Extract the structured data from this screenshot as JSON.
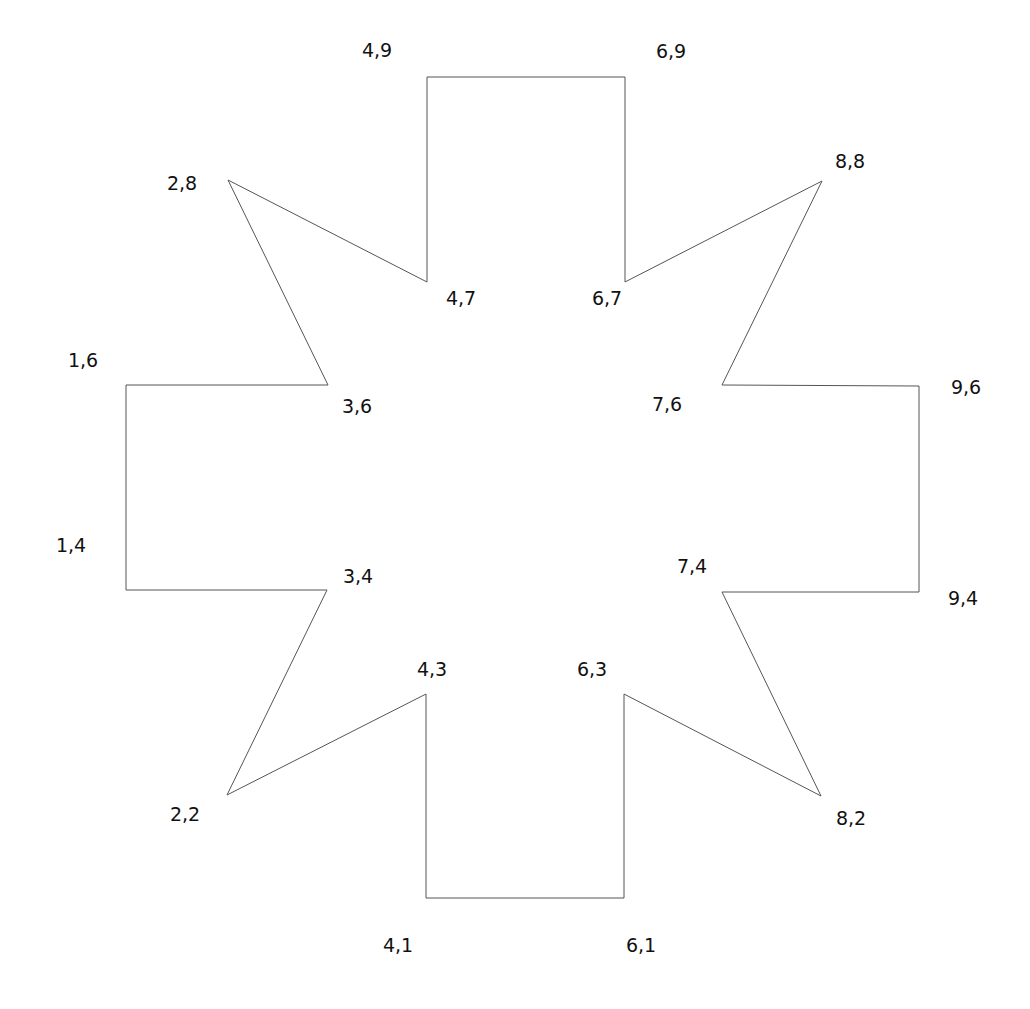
{
  "diagram": {
    "type": "polygon",
    "stroke_color": "#555555",
    "stroke_width": 1,
    "fill": "none",
    "vertices": [
      {
        "label": "4,9",
        "x": 427,
        "y": 77,
        "label_x": 377,
        "label_y": 50
      },
      {
        "label": "6,9",
        "x": 625,
        "y": 77,
        "label_x": 671,
        "label_y": 51
      },
      {
        "label": "6,7",
        "x": 625,
        "y": 282,
        "label_x": 607,
        "label_y": 298
      },
      {
        "label": "8,8",
        "x": 822,
        "y": 181,
        "label_x": 850,
        "label_y": 161
      },
      {
        "label": "7,6",
        "x": 722,
        "y": 385,
        "label_x": 667,
        "label_y": 404
      },
      {
        "label": "9,6",
        "x": 919,
        "y": 386,
        "label_x": 966,
        "label_y": 387
      },
      {
        "label": "9,4",
        "x": 919,
        "y": 592,
        "label_x": 963,
        "label_y": 598
      },
      {
        "label": "7,4",
        "x": 722,
        "y": 592,
        "label_x": 692,
        "label_y": 566
      },
      {
        "label": "8,2",
        "x": 821,
        "y": 796,
        "label_x": 851,
        "label_y": 818
      },
      {
        "label": "6,3",
        "x": 624,
        "y": 694,
        "label_x": 592,
        "label_y": 669
      },
      {
        "label": "6,1",
        "x": 624,
        "y": 898,
        "label_x": 641,
        "label_y": 945
      },
      {
        "label": "4,1",
        "x": 426,
        "y": 898,
        "label_x": 398,
        "label_y": 945
      },
      {
        "label": "4,3",
        "x": 426,
        "y": 694,
        "label_x": 432,
        "label_y": 669
      },
      {
        "label": "2,2",
        "x": 227,
        "y": 795,
        "label_x": 185,
        "label_y": 814
      },
      {
        "label": "3,4",
        "x": 327,
        "y": 590,
        "label_x": 358,
        "label_y": 576
      },
      {
        "label": "1,4",
        "x": 126,
        "y": 590,
        "label_x": 71,
        "label_y": 545
      },
      {
        "label": "1,6",
        "x": 126,
        "y": 385,
        "label_x": 83,
        "label_y": 360
      },
      {
        "label": "3,6",
        "x": 328,
        "y": 385,
        "label_x": 357,
        "label_y": 406
      },
      {
        "label": "2,8",
        "x": 228,
        "y": 180,
        "label_x": 182,
        "label_y": 183
      },
      {
        "label": "4,7",
        "x": 427,
        "y": 282,
        "label_x": 461,
        "label_y": 298
      }
    ]
  }
}
